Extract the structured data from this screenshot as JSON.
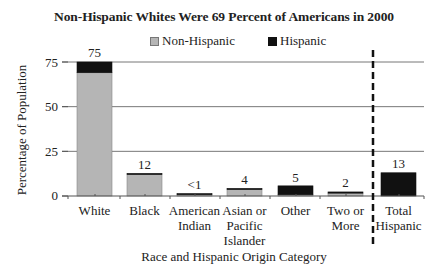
{
  "chart_data": {
    "type": "bar",
    "stacked": true,
    "title": "Non-Hispanic Whites Were 69 Percent of Americans in 2000",
    "xlabel": "Race and Hispanic Origin Category",
    "ylabel": "Percentage of Population",
    "ylim": [
      0,
      75
    ],
    "yticks": [
      "0",
      "25",
      "50",
      "75"
    ],
    "grid": true,
    "legend_position": "top",
    "categories": [
      "White",
      "Black",
      "American Indian",
      "Asian or Pacific Islander",
      "Other",
      "Two or More",
      "Total Hispanic"
    ],
    "category_lines": [
      [
        "White"
      ],
      [
        "Black"
      ],
      [
        "American",
        "Indian"
      ],
      [
        "Asian or",
        "Pacific",
        "Islander"
      ],
      [
        "Other"
      ],
      [
        "Two or",
        "More"
      ],
      [
        "Total",
        "Hispanic"
      ]
    ],
    "series": [
      {
        "name": "Non-Hispanic",
        "color": "#b5b5b5",
        "values": [
          69,
          12,
          0.7,
          3.6,
          0.2,
          1.6,
          0
        ]
      },
      {
        "name": "Hispanic",
        "color": "#111111",
        "values": [
          6,
          0.5,
          0.2,
          0.1,
          5,
          0.6,
          13
        ]
      }
    ],
    "value_labels": [
      "75",
      "12",
      "<1",
      "4",
      "5",
      "2",
      "13"
    ],
    "annotations": [
      "Dashed vertical divider separating race categories from Total Hispanic"
    ]
  },
  "legend": {
    "non_hispanic": "Non-Hispanic",
    "hispanic": "Hispanic"
  }
}
